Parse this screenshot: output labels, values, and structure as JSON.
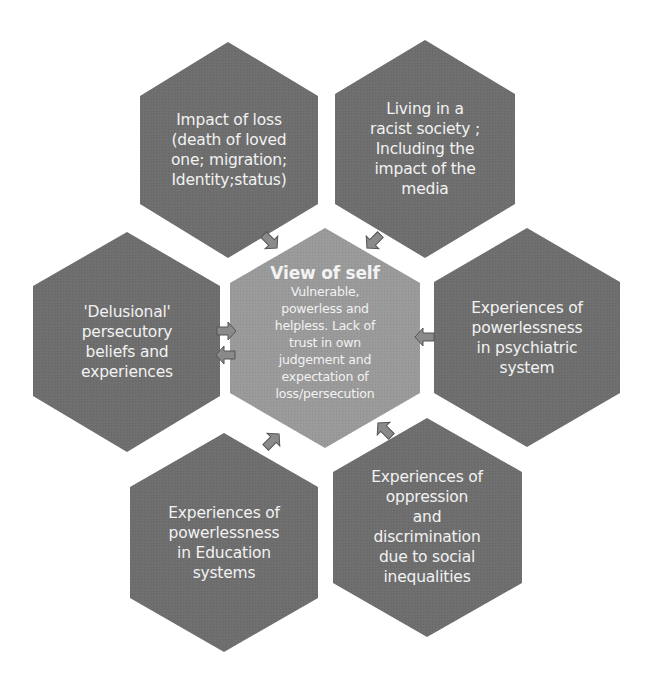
{
  "colors": {
    "outer_hex": "#6e6e6e",
    "center_hex": "#9a9a9a",
    "arrow_fill": "#8a8a8a",
    "arrow_stroke": "#555555",
    "text": "#f2f2f2",
    "background": "#ffffff"
  },
  "center": {
    "title": "View of self",
    "lines": [
      "Vulnerable,",
      "powerless and",
      "helpless. Lack of",
      "trust in own",
      "judgement and",
      "expectation of",
      "loss/persecution"
    ]
  },
  "hexes": [
    {
      "id": "top-left",
      "lines": [
        "Impact of loss",
        "(death of loved",
        "one; migration;",
        "Identity;status)"
      ]
    },
    {
      "id": "top-right",
      "lines": [
        "Living in a",
        "racist society ;",
        "Including the",
        "impact of the",
        "media"
      ]
    },
    {
      "id": "left",
      "lines": [
        "'Delusional'",
        "persecutory",
        "beliefs and",
        "experiences"
      ]
    },
    {
      "id": "right",
      "lines": [
        "Experiences of",
        "powerlessness",
        "in psychiatric",
        "system"
      ]
    },
    {
      "id": "bottom-left",
      "lines": [
        "Experiences of",
        "powerlessness",
        "in Education",
        "systems"
      ]
    },
    {
      "id": "bottom-right",
      "lines": [
        "Experiences of",
        "oppression",
        "and",
        "discrimination",
        "due to social",
        "inequalities"
      ]
    }
  ]
}
